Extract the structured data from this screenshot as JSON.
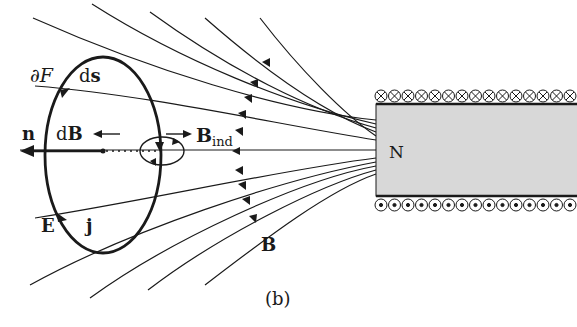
{
  "diagram": {
    "type": "magnetic-induction-illustration",
    "caption": "(b)",
    "magnet": {
      "pole_label": "N",
      "fill_color": "#d8d8d8",
      "top_winding_symbol": "⊗",
      "bottom_winding_symbol": "⊙",
      "winding_count": 15
    },
    "labels": {
      "boundary": "∂F",
      "line_element": "ds",
      "normal": "n",
      "delta_field": "dB",
      "induced_field_main": "B",
      "induced_field_sub": "ind",
      "electric_field": "E",
      "current_density": "j",
      "magnetic_field": "B"
    },
    "colors": {
      "ink": "#1a1a1a",
      "magnet_fill": "#d8d8d8",
      "background": "#ffffff"
    }
  }
}
